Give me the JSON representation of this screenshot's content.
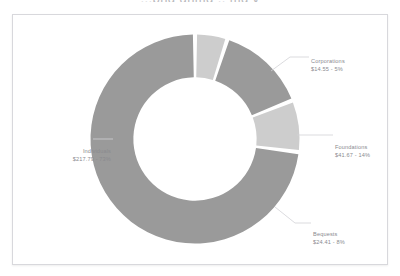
{
  "cut_title": "...png  gnmg  .. mg  y",
  "frame": {
    "border_color": "#d8d8dc",
    "background": "#ffffff"
  },
  "chart_data": {
    "type": "pie",
    "variant": "donut",
    "title": "",
    "xlabel": "",
    "ylabel": "",
    "legend_position": "none",
    "grid": false,
    "start_angle_deg": 0,
    "direction": "clockwise",
    "label_format": "{name}\n${value} - {percent}%",
    "categories": [
      "Corporations",
      "Foundations",
      "Bequests",
      "Individuals"
    ],
    "values": [
      14.55,
      41.67,
      24.41,
      217.79
    ],
    "percents": [
      5,
      14,
      8,
      73
    ],
    "value_labels": [
      "$14.55 - 5%",
      "$41.67 - 14%",
      "$24.41 - 8%",
      "$217.79 - 73%"
    ],
    "colors": [
      "#cdcdcd",
      "#9a9a9a",
      "#cdcdcd",
      "#9a9a9a"
    ],
    "slices": [
      {
        "name": "Corporations",
        "value": 14.55,
        "percent": 5,
        "amount_text": "$14.55",
        "percent_text": "5%",
        "label_text": "$14.55 - 5%",
        "color": "#cdcdcd"
      },
      {
        "name": "Foundations",
        "value": 41.67,
        "percent": 14,
        "amount_text": "$41.67",
        "percent_text": "14%",
        "label_text": "$41.67 - 14%",
        "color": "#9a9a9a"
      },
      {
        "name": "Bequests",
        "value": 24.41,
        "percent": 8,
        "amount_text": "$24.41",
        "percent_text": "8%",
        "label_text": "$24.41 - 8%",
        "color": "#cdcdcd"
      },
      {
        "name": "Individuals",
        "value": 217.79,
        "percent": 73,
        "amount_text": "$217.79",
        "percent_text": "73%",
        "label_text": "$217.79 - 73%",
        "color": "#9a9a9a"
      }
    ],
    "total": 298.42,
    "hole_ratio": 0.59,
    "segment_gap": true
  },
  "labels": {
    "corporations": {
      "name": "Corporations",
      "value": "$14.55 - 5%"
    },
    "foundations": {
      "name": "Foundations",
      "value": "$41.67 - 14%"
    },
    "bequests": {
      "name": "Bequests",
      "value": "$24.41 - 8%"
    },
    "individuals": {
      "name": "Individuals",
      "value": "$217.79 - 73%"
    }
  }
}
